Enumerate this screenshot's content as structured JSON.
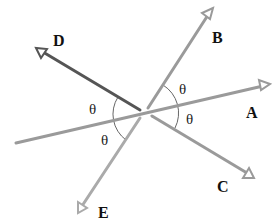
{
  "diagram": {
    "type": "geometry-rays",
    "center": [
      145,
      112
    ],
    "rays": [
      {
        "id": "A",
        "label": "A",
        "start": [
          16,
          143
        ],
        "tip": [
          270,
          84
        ],
        "color": "#9a9a9a",
        "label_pos": [
          246,
          118
        ]
      },
      {
        "id": "B",
        "label": "B",
        "start": [
          148,
          108
        ],
        "tip": [
          213,
          8
        ],
        "color": "#9a9a9a",
        "label_pos": [
          212,
          43
        ]
      },
      {
        "id": "C",
        "label": "C",
        "start": [
          152,
          116
        ],
        "tip": [
          254,
          178
        ],
        "color": "#9a9a9a",
        "label_pos": [
          217,
          192
        ]
      },
      {
        "id": "D",
        "label": "D",
        "start": [
          140,
          110
        ],
        "tip": [
          36,
          48
        ],
        "color": "#555555",
        "label_pos": [
          53,
          46
        ]
      },
      {
        "id": "E",
        "label": "E",
        "start": [
          140,
          118
        ],
        "tip": [
          78,
          213
        ],
        "color": "#aaaaaa",
        "label_pos": [
          98,
          218
        ]
      }
    ],
    "angles": [
      {
        "label": "θ",
        "between": [
          "B",
          "A"
        ],
        "pos": [
          179,
          94
        ]
      },
      {
        "label": "θ",
        "between": [
          "A",
          "C"
        ],
        "pos": [
          186,
          124
        ]
      },
      {
        "label": "θ",
        "between": [
          "D",
          "A"
        ],
        "pos": [
          89,
          114
        ]
      },
      {
        "label": "θ",
        "between": [
          "A",
          "E"
        ],
        "pos": [
          101,
          145
        ]
      }
    ],
    "arc_color": "#666666"
  }
}
